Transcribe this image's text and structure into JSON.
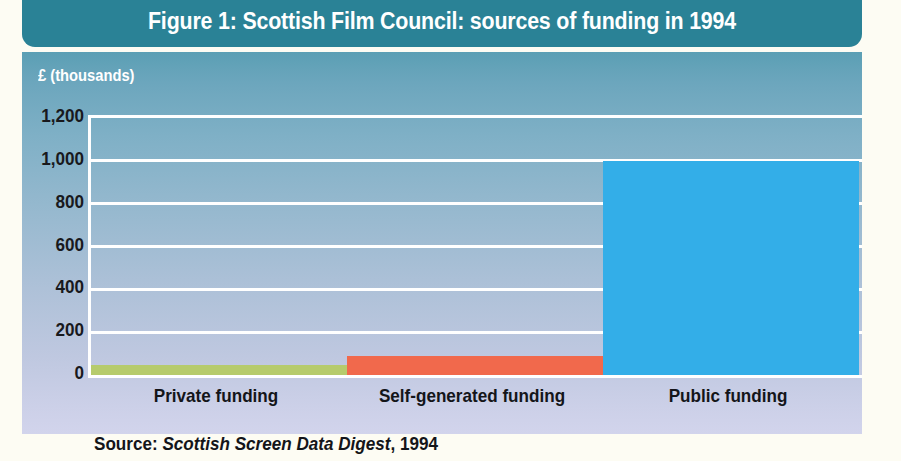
{
  "figure": {
    "title": "Figure 1: Scottish Film Council: sources of funding in 1994",
    "source_prefix": "Source: ",
    "source_publication": "Scottish Screen Data Digest",
    "source_suffix": ", 1994"
  },
  "colors": {
    "title_bar": "#2a8296",
    "title_text": "#ffffff",
    "page_background": "#fdfcf3",
    "plot_gradient_top": "#5b9fb4",
    "plot_gradient_bottom": "#d2d4ec",
    "gridline": "#ffffff",
    "private_funding": "#b6cb6c",
    "self_generated_funding": "#f1694c",
    "public_funding": "#33aee8",
    "tick_label": "#141519"
  },
  "chart_data": {
    "type": "bar",
    "title": "Figure 1: Scottish Film Council: sources of funding in 1994",
    "subtitle": "",
    "xlabel": "",
    "ylabel": "£ (thousands)",
    "categories": [
      "Private funding",
      "Self-generated funding",
      "Public funding"
    ],
    "values": [
      48,
      90,
      1000
    ],
    "series": [
      {
        "name": "Sources of funding",
        "values": [
          48,
          90,
          1000
        ],
        "colors": [
          "#b6cb6c",
          "#f1694c",
          "#33aee8"
        ]
      }
    ],
    "ylim": [
      0,
      1200
    ],
    "yticks": [
      0,
      200,
      400,
      600,
      800,
      1000,
      1200
    ],
    "ytick_labels": [
      "0",
      "200",
      "400",
      "600",
      "800",
      "1,000",
      "1,200"
    ],
    "grid": true,
    "grid_axis": "y",
    "legend": false,
    "legend_position": "none",
    "annotations": [],
    "units": "thousands of pounds sterling"
  }
}
